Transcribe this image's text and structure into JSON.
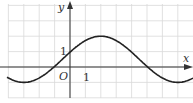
{
  "chart_data": {
    "type": "line",
    "title": "",
    "xlabel": "x",
    "ylabel": "y",
    "origin_label": "O",
    "tick_labels": {
      "x_unit": "1",
      "y_unit": "1"
    },
    "grid": true,
    "xlim": [
      -4.5,
      8
    ],
    "ylim": [
      -1.6,
      2.6
    ],
    "series": [
      {
        "name": "curve",
        "x": [
          -4.5,
          -3,
          -1,
          0,
          2,
          5,
          7,
          8
        ],
        "y": [
          -0.6,
          -1,
          0,
          1,
          2,
          0,
          -1,
          -0.6
        ]
      }
    ],
    "key_points": {
      "y_intercept": [
        0,
        1
      ],
      "maximum": [
        2,
        2
      ],
      "minima": [
        [
          -3,
          -1
        ],
        [
          7,
          -1
        ]
      ],
      "zeros": [
        -1,
        5
      ]
    }
  },
  "colors": {
    "grid": "#d9d9d9",
    "axis": "#333333",
    "curve": "#222222"
  }
}
